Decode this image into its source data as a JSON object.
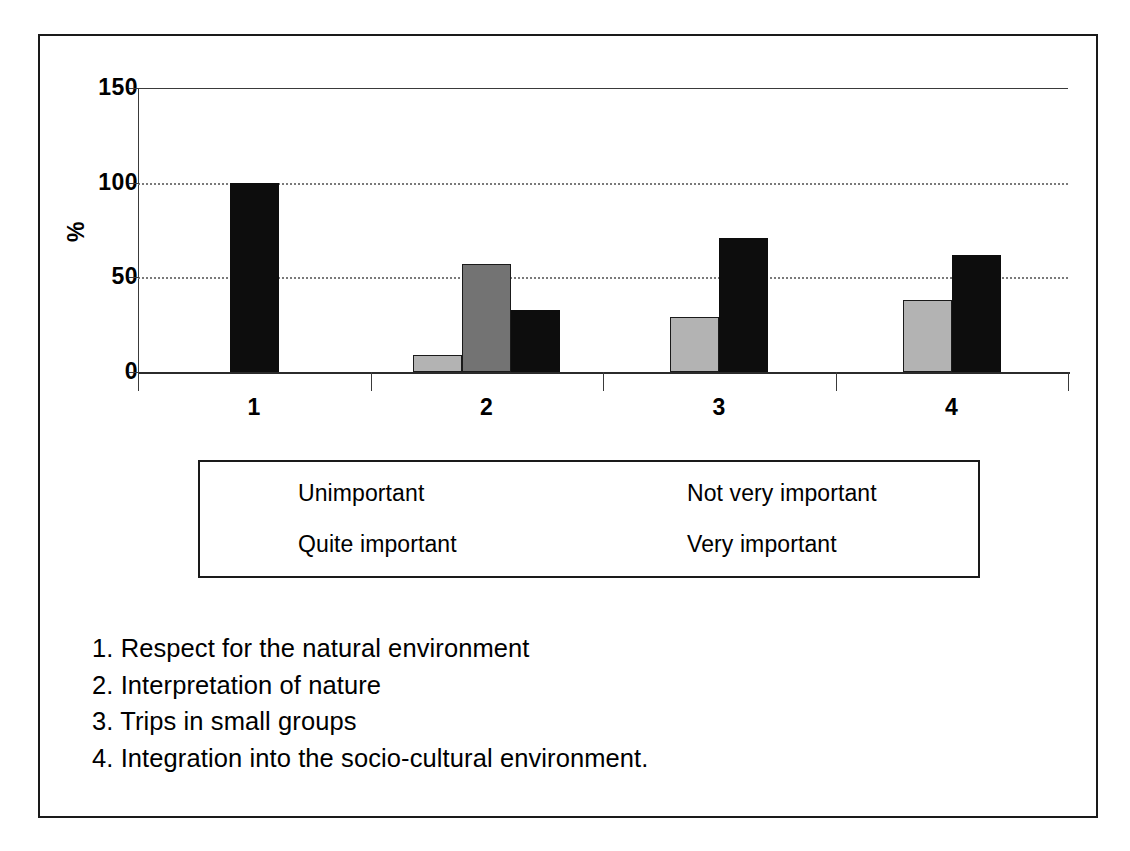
{
  "figure": {
    "caption_remnant": "g. .. p.. .. p...... .. ..p..  g...",
    "y_axis_title": "%"
  },
  "chart_data": {
    "type": "bar",
    "title": "",
    "xlabel": "",
    "ylabel": "%",
    "ylim": [
      0,
      150
    ],
    "yticks": [
      0,
      50,
      100,
      150
    ],
    "ytick_labels": [
      "0",
      "50",
      "100",
      "150"
    ],
    "grid": "horizontal-dotted",
    "legend_position": "below-plot",
    "categories": [
      "1",
      "2",
      "3",
      "4"
    ],
    "series": [
      {
        "name": "Unimportant",
        "color": "#ffffff",
        "values": [
          0,
          0,
          0,
          0
        ]
      },
      {
        "name": "Not very important",
        "color": "#b3b3b3",
        "values": [
          0,
          9,
          29,
          38
        ]
      },
      {
        "name": "Quite important",
        "color": "#737373",
        "values": [
          0,
          57,
          0,
          0
        ]
      },
      {
        "name": "Very important",
        "color": "#0d0d0d",
        "values": [
          100,
          33,
          71,
          62
        ]
      }
    ]
  },
  "legend": {
    "items": [
      {
        "label": "Unimportant",
        "swatch": "sw-unimportant"
      },
      {
        "label": "Not very important",
        "swatch": "sw-notvery"
      },
      {
        "label": "Quite important",
        "swatch": "sw-quite"
      },
      {
        "label": "Very important",
        "swatch": "sw-very"
      }
    ]
  },
  "caption": {
    "items": [
      "1. Respect for the natural environment",
      "2. Interpretation of nature",
      "3. Trips in small groups",
      "4. Integration into the socio-cultural environment."
    ]
  }
}
